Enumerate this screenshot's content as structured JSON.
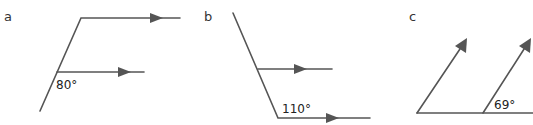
{
  "figures": [
    {
      "id": "a",
      "label": "a",
      "angle_label": "80°",
      "description": "Transversal crossing two parallel horizontal arrowed lines"
    },
    {
      "id": "b",
      "label": "b",
      "angle_label": "110°",
      "description": "Transversal meeting two parallel horizontal arrowed lines"
    },
    {
      "id": "c",
      "label": "c",
      "angle_label": "69°",
      "description": "Two parallel arrowed rays rising from a horizontal base line"
    }
  ],
  "colors": {
    "line": "#555555",
    "text": "#333333",
    "background": "#ffffff"
  }
}
